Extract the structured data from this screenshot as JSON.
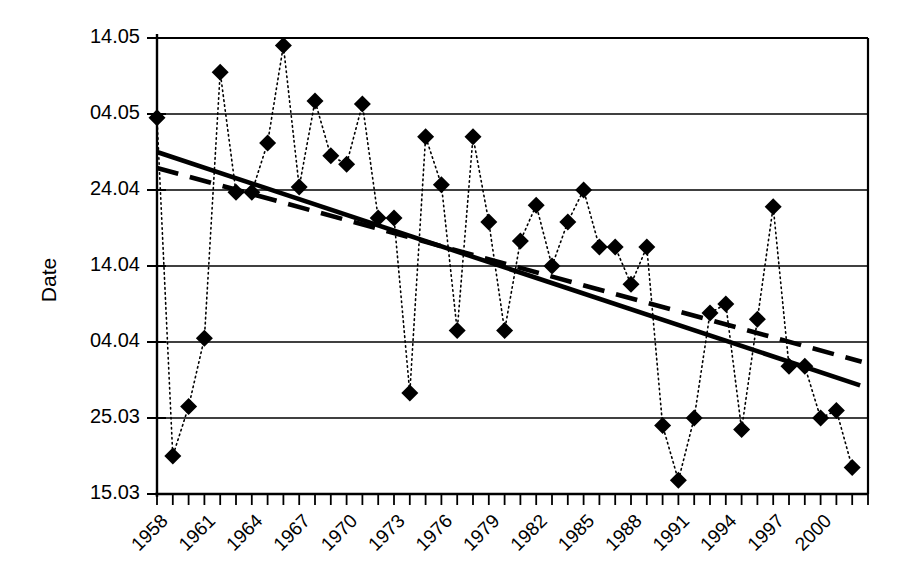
{
  "chart_data": {
    "type": "line",
    "title": "",
    "xlabel": "",
    "ylabel": "Date",
    "ylim": [
      0,
      6
    ],
    "ytick_labels": [
      "14.05",
      "04.05",
      "24.04",
      "14.04",
      "04.04",
      "25.03",
      "15.03"
    ],
    "ytick_values": [
      6,
      5,
      4,
      3,
      2,
      1,
      0
    ],
    "xlim": [
      1958,
      2003
    ],
    "xtick_labels": [
      "1958",
      "1961",
      "1964",
      "1967",
      "1970",
      "1973",
      "1976",
      "1979",
      "1982",
      "1985",
      "1988",
      "1991",
      "1994",
      "1997",
      "2000"
    ],
    "xtick_values": [
      1958,
      1961,
      1964,
      1967,
      1970,
      1973,
      1976,
      1979,
      1982,
      1985,
      1988,
      1991,
      1994,
      1997,
      2000
    ],
    "grid": true,
    "legend": "none",
    "marker": "diamond",
    "line_style": "dotted",
    "x": [
      1958,
      1959,
      1960,
      1961,
      1962,
      1963,
      1964,
      1965,
      1966,
      1967,
      1968,
      1969,
      1970,
      1971,
      1972,
      1973,
      1974,
      1975,
      1976,
      1977,
      1978,
      1979,
      1980,
      1981,
      1982,
      1983,
      1984,
      1985,
      1986,
      1987,
      1988,
      1989,
      1990,
      1991,
      1992,
      1993,
      1994,
      1995,
      1996,
      1997,
      1998,
      1999,
      2000,
      2001,
      2002
    ],
    "y": [
      4.95,
      0.5,
      1.15,
      2.05,
      5.55,
      3.97,
      3.97,
      4.62,
      5.9,
      4.04,
      5.17,
      4.45,
      4.34,
      5.13,
      3.63,
      3.63,
      1.33,
      4.7,
      4.07,
      2.15,
      4.7,
      3.58,
      2.15,
      3.33,
      3.8,
      3.0,
      3.58,
      4.0,
      3.25,
      3.25,
      2.76,
      3.25,
      0.9,
      0.18,
      1.0,
      2.38,
      2.5,
      0.85,
      2.3,
      3.78,
      1.68,
      1.68,
      1.0,
      1.1,
      0.35
    ],
    "series": [
      {
        "name": "Observed date",
        "style": "dotted-with-diamond-markers",
        "values": [
          4.95,
          0.5,
          1.15,
          2.05,
          5.55,
          3.97,
          3.97,
          4.62,
          5.9,
          4.04,
          5.17,
          4.45,
          4.34,
          5.13,
          3.63,
          3.63,
          1.33,
          4.7,
          4.07,
          2.15,
          4.7,
          3.58,
          2.15,
          3.33,
          3.8,
          3.0,
          3.58,
          4.0,
          3.25,
          3.25,
          2.76,
          3.25,
          0.9,
          0.18,
          1.0,
          2.38,
          2.5,
          0.85,
          2.3,
          3.78,
          1.68,
          1.68,
          1.0,
          1.1,
          0.35
        ]
      },
      {
        "name": "Linear trend (solid)",
        "style": "solid-thick",
        "endpoints": [
          {
            "x": 1958,
            "y": 4.5
          },
          {
            "x": 2002.5,
            "y": 1.43
          }
        ]
      },
      {
        "name": "Linear trend (dashed)",
        "style": "dashed-thick",
        "endpoints": [
          {
            "x": 1958,
            "y": 4.29
          },
          {
            "x": 2002.6,
            "y": 1.74
          }
        ]
      }
    ],
    "annotations": []
  },
  "axes": {
    "y_title": "Date"
  }
}
